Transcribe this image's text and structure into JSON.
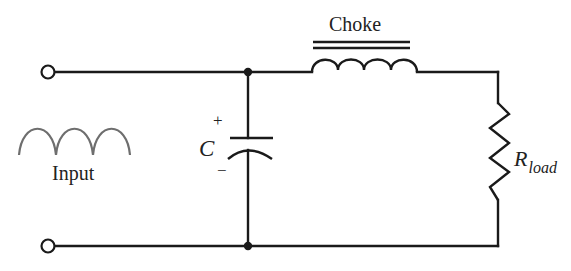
{
  "diagram": {
    "labels": {
      "choke": "Choke",
      "input": "Input",
      "capacitor": "C",
      "capacitor_plus": "+",
      "capacitor_minus": "−",
      "load_main": "R",
      "load_sub": "load"
    },
    "components": [
      {
        "id": "input-terminals",
        "type": "terminal-pair",
        "label": "Input"
      },
      {
        "id": "C",
        "type": "polarized-capacitor",
        "label": "C",
        "polarity": [
          "+",
          "-"
        ]
      },
      {
        "id": "choke",
        "type": "iron-core-inductor",
        "label": "Choke"
      },
      {
        "id": "Rload",
        "type": "resistor",
        "label": "R_load"
      }
    ],
    "colors": {
      "wire": "#1a1a1a",
      "waveform": "#6e6e6e",
      "background": "#ffffff"
    }
  }
}
